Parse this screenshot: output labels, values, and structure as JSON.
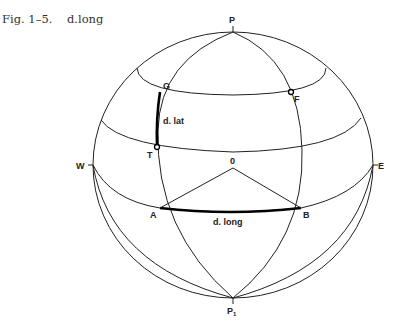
{
  "figure": {
    "caption": "Fig. 1–5.    d.long"
  },
  "labels": {
    "north_pole": "P",
    "south_pole": "P",
    "south_pole_subscript": "1",
    "west": "W",
    "east": "E",
    "center": "0",
    "point_g": "G",
    "point_f": "F",
    "point_t": "T",
    "point_a": "A",
    "point_b": "B",
    "d_lat": "d. lat",
    "d_long": "d. long"
  },
  "colors": {
    "line": "#222222",
    "emphasis": "#000000",
    "background": "#ffffff"
  }
}
